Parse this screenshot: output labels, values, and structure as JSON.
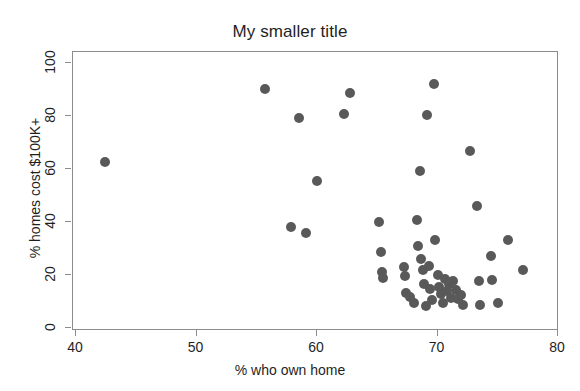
{
  "chart_data": {
    "type": "scatter",
    "title": "My smaller title",
    "xlabel": "% who own home",
    "ylabel": "% homes cost $100K+",
    "xlim": [
      40,
      80
    ],
    "ylim": [
      0,
      100
    ],
    "xticks": [
      40,
      50,
      60,
      70,
      80
    ],
    "yticks": [
      0,
      20,
      40,
      60,
      80,
      100
    ],
    "grid": false,
    "legend": null,
    "marker_color": "#595959",
    "marker_size": 10,
    "frame_color": "#8c8c8c",
    "background": "#ffffff",
    "series": [
      {
        "name": "states",
        "points": [
          [
            42.5,
            62.3
          ],
          [
            55.8,
            89.9
          ],
          [
            57.9,
            37.8
          ],
          [
            58.6,
            79.0
          ],
          [
            59.2,
            35.4
          ],
          [
            60.1,
            55.1
          ],
          [
            62.3,
            80.4
          ],
          [
            62.8,
            88.3
          ],
          [
            65.2,
            39.8
          ],
          [
            65.4,
            28.2
          ],
          [
            65.5,
            20.8
          ],
          [
            65.6,
            18.4
          ],
          [
            67.3,
            22.6
          ],
          [
            67.4,
            19.4
          ],
          [
            67.5,
            13.0
          ],
          [
            67.8,
            11.2
          ],
          [
            68.1,
            9.2
          ],
          [
            68.4,
            40.4
          ],
          [
            68.5,
            30.5
          ],
          [
            68.6,
            58.9
          ],
          [
            68.7,
            25.6
          ],
          [
            68.9,
            21.4
          ],
          [
            69.0,
            16.2
          ],
          [
            69.1,
            8.0
          ],
          [
            69.2,
            79.9
          ],
          [
            69.4,
            23.0
          ],
          [
            69.5,
            14.5
          ],
          [
            69.6,
            10.2
          ],
          [
            69.8,
            91.8
          ],
          [
            69.9,
            32.9
          ],
          [
            70.1,
            19.6
          ],
          [
            70.2,
            15.1
          ],
          [
            70.4,
            12.5
          ],
          [
            70.5,
            9.0
          ],
          [
            70.7,
            18.2
          ],
          [
            70.9,
            13.7
          ],
          [
            71.0,
            16.4
          ],
          [
            71.2,
            11.1
          ],
          [
            71.4,
            17.4
          ],
          [
            71.6,
            14.0
          ],
          [
            71.8,
            10.6
          ],
          [
            72.0,
            12.0
          ],
          [
            72.2,
            8.4
          ],
          [
            72.8,
            66.4
          ],
          [
            73.4,
            45.8
          ],
          [
            73.5,
            17.5
          ],
          [
            73.6,
            8.4
          ],
          [
            74.5,
            26.8
          ],
          [
            74.6,
            17.7
          ],
          [
            75.1,
            9.1
          ],
          [
            75.9,
            33.0
          ],
          [
            77.2,
            21.5
          ]
        ]
      }
    ]
  },
  "axes": {
    "x_tick_labels": [
      "40",
      "50",
      "60",
      "70",
      "80"
    ],
    "y_tick_labels": [
      "0",
      "20",
      "40",
      "60",
      "80",
      "100"
    ]
  }
}
